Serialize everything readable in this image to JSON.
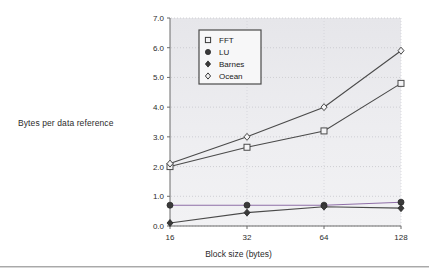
{
  "figure": {
    "y_axis_title": "Bytes per data reference",
    "x_axis_title": "Block size (bytes)"
  },
  "legend": {
    "items": [
      {
        "label": "FFT",
        "marker": "open-square"
      },
      {
        "label": "LU",
        "marker": "filled-circle"
      },
      {
        "label": "Barnes",
        "marker": "filled-diamond"
      },
      {
        "label": "Ocean",
        "marker": "open-diamond"
      }
    ]
  },
  "axes": {
    "y_ticks": [
      "0.0",
      "1.0",
      "2.0",
      "3.0",
      "4.0",
      "5.0",
      "6.0",
      "7.0"
    ],
    "x_ticks": [
      "16",
      "32",
      "64",
      "128"
    ]
  },
  "colors": {
    "panel": "#e9e9ec",
    "line": "#4a4a4a",
    "lu_accent": "#8f6fa8",
    "axis": "#6b6b6b",
    "text": "#2b2b2b"
  },
  "chart_data": {
    "type": "line",
    "title": "",
    "xlabel": "Block size (bytes)",
    "ylabel": "Bytes per data reference",
    "x": [
      16,
      32,
      64,
      128
    ],
    "categories": [
      "16",
      "32",
      "64",
      "128"
    ],
    "xscale": "log2",
    "ylim": [
      0.0,
      7.0
    ],
    "yticks": [
      0.0,
      1.0,
      2.0,
      3.0,
      4.0,
      5.0,
      6.0,
      7.0
    ],
    "grid": true,
    "legend_position": "upper-left-inside",
    "series": [
      {
        "name": "FFT",
        "marker": "open-square",
        "values": [
          2.0,
          2.65,
          3.2,
          4.8
        ]
      },
      {
        "name": "LU",
        "marker": "filled-circle",
        "values": [
          0.7,
          0.7,
          0.7,
          0.8
        ]
      },
      {
        "name": "Barnes",
        "marker": "filled-diamond",
        "values": [
          0.1,
          0.45,
          0.65,
          0.6
        ]
      },
      {
        "name": "Ocean",
        "marker": "open-diamond",
        "values": [
          2.1,
          3.0,
          4.0,
          5.9
        ]
      }
    ]
  }
}
